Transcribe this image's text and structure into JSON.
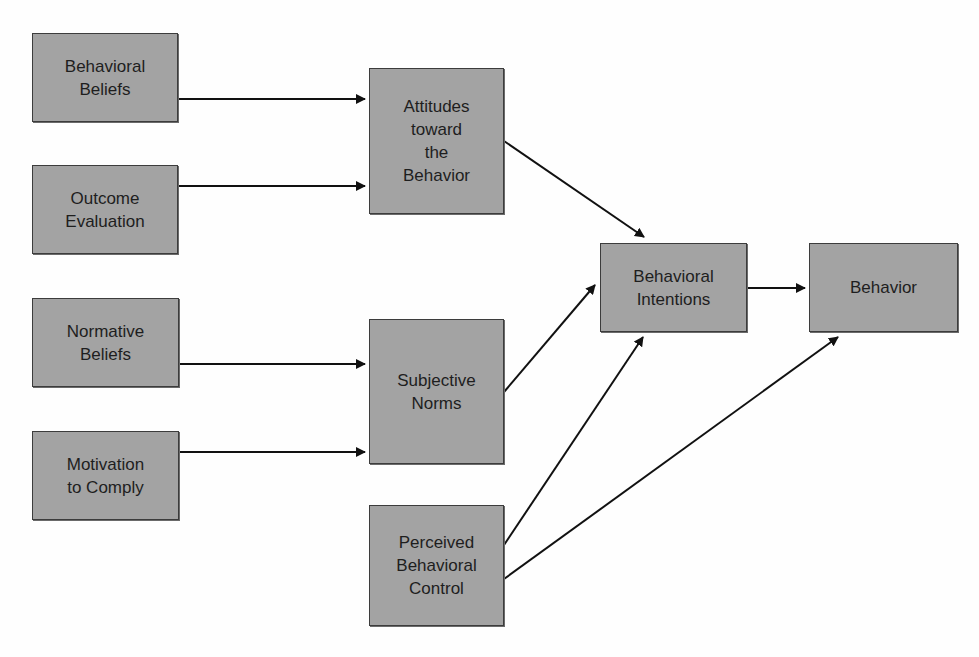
{
  "diagram": {
    "type": "flowchart",
    "title": "",
    "colors": {
      "box_fill": "#a3a3a3",
      "box_border": "#3c3c3c",
      "arrow": "#111111",
      "text": "#1e1e1e",
      "background": "#fefefe"
    },
    "nodes": [
      {
        "id": "behavioral_beliefs",
        "label": "Behavioral\nBeliefs",
        "x": 32,
        "y": 33,
        "w": 146,
        "h": 89
      },
      {
        "id": "outcome_evaluation",
        "label": "Outcome\nEvaluation",
        "x": 32,
        "y": 165,
        "w": 146,
        "h": 89
      },
      {
        "id": "normative_beliefs",
        "label": "Normative\nBeliefs",
        "x": 32,
        "y": 298,
        "w": 147,
        "h": 89
      },
      {
        "id": "motivation_to_comply",
        "label": "Motivation\nto Comply",
        "x": 32,
        "y": 431,
        "w": 147,
        "h": 89
      },
      {
        "id": "attitudes",
        "label": "Attitudes\ntoward\nthe\nBehavior",
        "x": 369,
        "y": 68,
        "w": 135,
        "h": 146
      },
      {
        "id": "subjective_norms",
        "label": "Subjective\nNorms",
        "x": 369,
        "y": 319,
        "w": 135,
        "h": 145
      },
      {
        "id": "perceived_control",
        "label": "Perceived\nBehavioral\nControl",
        "x": 369,
        "y": 505,
        "w": 135,
        "h": 121
      },
      {
        "id": "behavioral_intentions",
        "label": "Behavioral\nIntentions",
        "x": 600,
        "y": 243,
        "w": 147,
        "h": 89
      },
      {
        "id": "behavior",
        "label": "Behavior",
        "x": 809,
        "y": 243,
        "w": 149,
        "h": 89
      }
    ],
    "edges": [
      {
        "from": "behavioral_beliefs",
        "to": "attitudes",
        "x1": 178,
        "y1": 99,
        "x2": 365,
        "y2": 99
      },
      {
        "from": "outcome_evaluation",
        "to": "attitudes",
        "x1": 178,
        "y1": 186,
        "x2": 365,
        "y2": 186
      },
      {
        "from": "normative_beliefs",
        "to": "subjective_norms",
        "x1": 179,
        "y1": 364,
        "x2": 365,
        "y2": 364
      },
      {
        "from": "motivation_to_comply",
        "to": "subjective_norms",
        "x1": 179,
        "y1": 452,
        "x2": 365,
        "y2": 452
      },
      {
        "from": "attitudes",
        "to": "behavioral_intentions",
        "x1": 504,
        "y1": 141,
        "x2": 644,
        "y2": 237
      },
      {
        "from": "subjective_norms",
        "to": "behavioral_intentions",
        "x1": 504,
        "y1": 392,
        "x2": 595,
        "y2": 285
      },
      {
        "from": "perceived_control",
        "to": "behavioral_intentions",
        "x1": 504,
        "y1": 545,
        "x2": 643,
        "y2": 337
      },
      {
        "from": "behavioral_intentions",
        "to": "behavior",
        "x1": 747,
        "y1": 288,
        "x2": 805,
        "y2": 288
      },
      {
        "from": "perceived_control",
        "to": "behavior",
        "x1": 504,
        "y1": 579,
        "x2": 838,
        "y2": 337
      }
    ]
  }
}
